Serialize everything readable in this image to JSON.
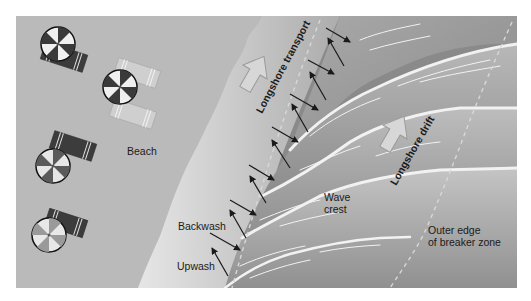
{
  "diagram": {
    "type": "illustration",
    "palette": {
      "beach": "#b9b9b9",
      "shore_light": "#e2e2e2",
      "swash_dark": "#7a7a7a",
      "water": "#8f8f8f",
      "wave_crest": "#efefef",
      "arrow": "#1a1a1a",
      "block_arrow_fill": "#d8d8d8",
      "text": "#1a1a1a"
    },
    "labels": {
      "beach": "Beach",
      "longshore_transport": "Longshore transport",
      "longshore_drift": "Longshore drift",
      "backwash": "Backwash",
      "upwash": "Upwash",
      "wave_crest_line1": "Wave",
      "wave_crest_line2": "crest",
      "outer_edge_line1": "Outer edge",
      "outer_edge_line2": "of breaker zone"
    },
    "umbrellas": [
      {
        "name": "umbrella-1",
        "cx": 58,
        "cy": 44
      },
      {
        "name": "umbrella-2",
        "cx": 120,
        "cy": 87
      },
      {
        "name": "umbrella-3",
        "cx": 53,
        "cy": 168
      },
      {
        "name": "umbrella-4",
        "cx": 49,
        "cy": 235
      }
    ],
    "towels": [
      {
        "name": "towel-1",
        "shade": "dark"
      },
      {
        "name": "towel-2",
        "shade": "light"
      },
      {
        "name": "towel-3",
        "shade": "light"
      },
      {
        "name": "towel-4",
        "shade": "dark"
      },
      {
        "name": "towel-5",
        "shade": "dark"
      }
    ],
    "swash_arrows": {
      "upwash_count": 7,
      "backwash_count": 7
    }
  }
}
